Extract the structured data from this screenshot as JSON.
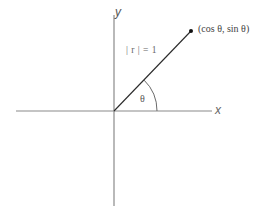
{
  "diagram": {
    "axes": {
      "x_label": "x",
      "y_label": "y"
    },
    "labels": {
      "point": "(cos θ, sin θ)",
      "radius": "| r | = 1",
      "angle": "θ"
    },
    "colors": {
      "axis": "#8a8a8a",
      "ray": "#2a2a2a",
      "arc": "#6a6a6a",
      "point": "#111111",
      "text": "#4a4a4a"
    }
  }
}
